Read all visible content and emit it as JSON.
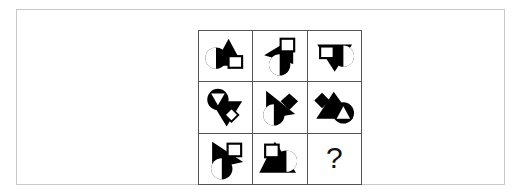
{
  "figure": {
    "type": "matrix-reasoning-puzzle",
    "rows": 3,
    "columns": 3,
    "ink_color": "#000000",
    "paper_color": "#ffffff",
    "grid_line_color": "#555555",
    "frame_color": "#c9c9c9"
  },
  "matrix": {
    "cells": [
      {
        "id": "cell-r1c1",
        "position": "row1-col1",
        "description": "black circle overlapping black triangle and white outlined square",
        "shapes": [
          "circle",
          "triangle",
          "square"
        ],
        "answer_cell": false
      },
      {
        "id": "cell-r1c2",
        "position": "row1-col2",
        "description": "black left-pointing triangle with white outlined square top-right and black circle bottom",
        "shapes": [
          "triangle",
          "square",
          "circle"
        ],
        "answer_cell": false
      },
      {
        "id": "cell-r1c3",
        "position": "row1-col3",
        "description": "black down-pointing triangle with white square top-left and black circle right",
        "shapes": [
          "triangle",
          "square",
          "circle"
        ],
        "answer_cell": false
      },
      {
        "id": "cell-r2c1",
        "position": "row2-col1",
        "description": "black circle with white wedge upper-left, black triangle and white diamond",
        "shapes": [
          "circle",
          "triangle",
          "diamond"
        ],
        "answer_cell": false
      },
      {
        "id": "cell-r2c2",
        "position": "row2-col2",
        "description": "black right-pointing triangle, rotated black square, black circle with white wedge",
        "shapes": [
          "triangle",
          "square",
          "circle"
        ],
        "answer_cell": false
      },
      {
        "id": "cell-r2c3",
        "position": "row2-col3",
        "description": "rotated black square upper-left, black triangle, black circle with white triangle",
        "shapes": [
          "square",
          "triangle",
          "circle"
        ],
        "answer_cell": false
      },
      {
        "id": "cell-r3c1",
        "position": "row3-col1",
        "description": "black right-pointing triangle, white outlined square top-right, black circle with white wedge",
        "shapes": [
          "triangle",
          "square",
          "circle"
        ],
        "answer_cell": false
      },
      {
        "id": "cell-r3c2",
        "position": "row3-col2",
        "description": "black triangle with white square top-left and black circle right with white wedge",
        "shapes": [
          "triangle",
          "square",
          "circle"
        ],
        "answer_cell": false
      },
      {
        "id": "cell-r3c3",
        "position": "row3-col3",
        "description": "missing element placeholder",
        "shapes": [],
        "answer_cell": true,
        "label": "?"
      }
    ]
  }
}
